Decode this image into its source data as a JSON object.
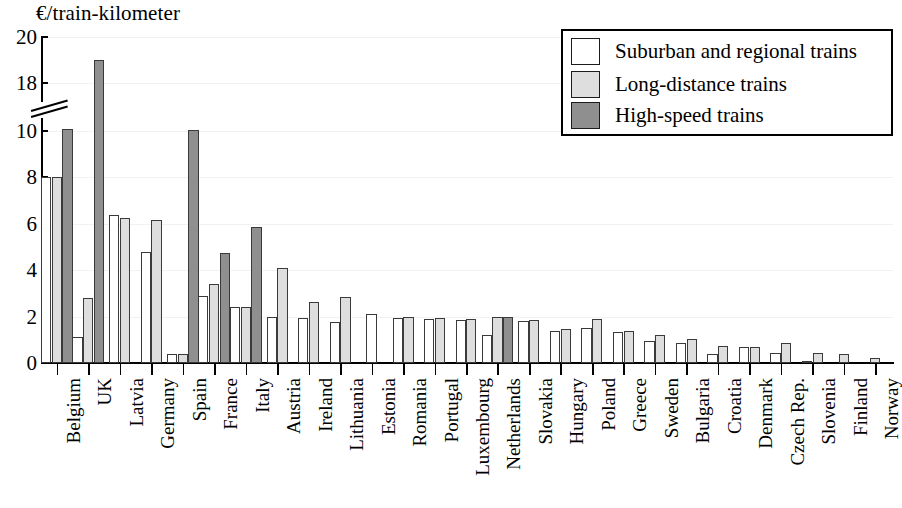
{
  "chart_data": {
    "type": "bar",
    "title": "",
    "ylabel": "€/train-kilometer",
    "xlabel": "",
    "ylim": [
      0,
      20
    ],
    "yticks": [
      0,
      2,
      4,
      6,
      8,
      10,
      18,
      20
    ],
    "ytick_labels": [
      "0",
      "2",
      "4",
      "6",
      "8",
      "10",
      "18",
      "20"
    ],
    "axis_break": {
      "present": true,
      "between": [
        10,
        18
      ]
    },
    "grid": true,
    "legend_position": "top-right",
    "categories": [
      "Belgium",
      "UK",
      "Latvia",
      "Germany",
      "Spain",
      "France",
      "Italy",
      "Austria",
      "Ireland",
      "Lithuania",
      "Estonia",
      "Romania",
      "Portugal",
      "Luxembourg",
      "Netherlands",
      "Slovakia",
      "Hungary",
      "Poland",
      "Greece",
      "Sweden",
      "Bulgaria",
      "Croatia",
      "Denmark",
      "Czech Rep.",
      "Slovenia",
      "Finland",
      "Norway"
    ],
    "series": [
      {
        "name": "Suburban and regional trains",
        "color": "#ffffff",
        "values": [
          8.0,
          1.1,
          6.4,
          4.8,
          0.4,
          2.9,
          2.4,
          2.0,
          1.95,
          1.75,
          2.1,
          1.95,
          1.9,
          1.85,
          1.2,
          1.8,
          1.4,
          1.5,
          1.35,
          0.95,
          0.85,
          0.4,
          0.7,
          0.45,
          0.05,
          null,
          null
        ]
      },
      {
        "name": "Long-distance trains",
        "color": "#dedede",
        "values": [
          8.0,
          2.8,
          6.25,
          6.15,
          0.4,
          3.4,
          2.4,
          4.1,
          2.65,
          2.85,
          null,
          2.0,
          1.95,
          1.9,
          2.0,
          1.85,
          1.45,
          1.9,
          1.4,
          1.2,
          1.05,
          0.75,
          0.7,
          0.85,
          0.45,
          0.4,
          0.2
        ]
      },
      {
        "name": "High-speed trains",
        "color": "#8f8f8f",
        "values": [
          10.3,
          19.0,
          null,
          null,
          10.2,
          4.75,
          5.85,
          null,
          null,
          null,
          null,
          null,
          null,
          null,
          2.0,
          null,
          null,
          null,
          null,
          null,
          null,
          null,
          null,
          null,
          null,
          null,
          null
        ]
      }
    ]
  },
  "legend": {
    "items": [
      {
        "label": "Suburban and regional trains"
      },
      {
        "label": "Long-distance trains"
      },
      {
        "label": "High-speed trains"
      }
    ]
  }
}
